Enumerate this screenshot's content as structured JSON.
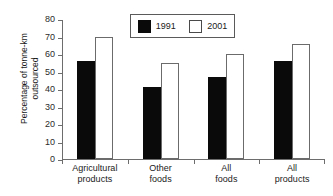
{
  "chart_data": {
    "type": "bar",
    "title": "",
    "xlabel": "",
    "ylabel": "Percentage of tonne-km outsourced",
    "ylabel_line1": "Percentage of tonne-km",
    "ylabel_line2": "outsourced",
    "ylim": [
      0,
      80
    ],
    "ytick_values": [
      0,
      10,
      20,
      30,
      40,
      50,
      60,
      70,
      80
    ],
    "ytick_labels": [
      "0",
      "10",
      "20",
      "30",
      "40",
      "50",
      "60",
      "70",
      "80"
    ],
    "grid": false,
    "legend_position": "top-center",
    "categories": [
      "Agricultural products",
      "Other foods",
      "All foods",
      "All products"
    ],
    "category_lines": [
      [
        "Agricultural",
        "products"
      ],
      [
        "Other",
        "foods"
      ],
      [
        "All",
        "foods"
      ],
      [
        "All",
        "products"
      ]
    ],
    "series": [
      {
        "name": "1991",
        "color": "#0a0a0a",
        "fill": "solid-black",
        "values": [
          56,
          41,
          47,
          56
        ]
      },
      {
        "name": "2001",
        "color": "#ffffff",
        "fill": "white-outline",
        "values": [
          69.5,
          55,
          60,
          66
        ]
      }
    ]
  },
  "legend": {
    "items": [
      {
        "label": "1991",
        "swatch": "black"
      },
      {
        "label": "2001",
        "swatch": "white"
      }
    ]
  },
  "colors": {
    "series_1991": "#0a0a0a",
    "series_2001": "#ffffff",
    "axis": "#6d6d6d",
    "text": "#1a1a1a",
    "background": "#ffffff"
  }
}
